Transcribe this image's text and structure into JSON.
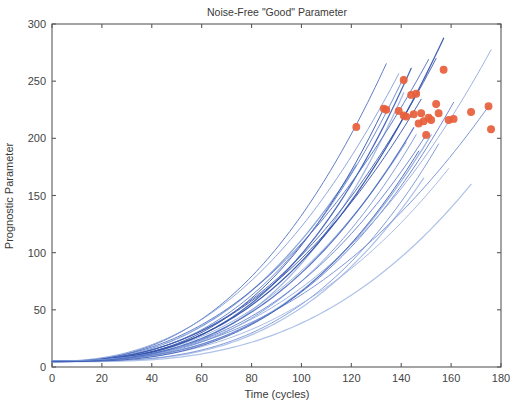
{
  "chart_data": {
    "type": "line",
    "title": "Noise-Free \"Good\" Parameter",
    "xlabel": "Time (cycles)",
    "ylabel": "Prognostic Parameter",
    "xlim": [
      0,
      180
    ],
    "ylim": [
      0,
      300
    ],
    "xticks": [
      0,
      20,
      40,
      60,
      80,
      100,
      120,
      140,
      160,
      180
    ],
    "yticks": [
      0,
      50,
      100,
      150,
      200,
      250,
      300
    ],
    "xtick_labels": [
      "0",
      "20",
      "40",
      "60",
      "80",
      "100",
      "120",
      "140",
      "160",
      "180"
    ],
    "ytick_labels": [
      "0",
      "50",
      "100",
      "150",
      "200",
      "250",
      "300"
    ],
    "grid": false,
    "legend": "none",
    "box": true,
    "line_color_dark": "#2f4fa8",
    "line_color_light": "#8fa9dd",
    "marker_color": "#e8603c",
    "marker_symbol": "filled-circle",
    "note": "Run-to-failure degradation trajectories; each curve ends at a red failure-threshold marker.",
    "series": [
      {
        "name": "unit-1",
        "color": "#7e9cd8",
        "start": 5.0,
        "end_x": 122,
        "end_y": 210
      },
      {
        "name": "unit-2",
        "color": "#2f4fa8",
        "start": 5.2,
        "end_x": 133,
        "end_y": 226
      },
      {
        "name": "unit-3",
        "color": "#4d6cc0",
        "start": 4.6,
        "end_x": 134,
        "end_y": 225
      },
      {
        "name": "unit-4",
        "color": "#9bb2e0",
        "start": 5.4,
        "end_x": 141,
        "end_y": 251
      },
      {
        "name": "unit-5",
        "color": "#5d7ccb",
        "start": 4.8,
        "end_x": 141,
        "end_y": 220
      },
      {
        "name": "unit-6",
        "color": "#8fa9dd",
        "start": 5.1,
        "end_x": 142,
        "end_y": 219
      },
      {
        "name": "unit-7",
        "color": "#3c5cb4",
        "start": 4.9,
        "end_x": 144,
        "end_y": 238
      },
      {
        "name": "unit-8",
        "color": "#7490d4",
        "start": 5.3,
        "end_x": 146,
        "end_y": 239
      },
      {
        "name": "unit-9",
        "color": "#2f4fa8",
        "start": 4.7,
        "end_x": 148,
        "end_y": 222
      },
      {
        "name": "unit-10",
        "color": "#a8bde6",
        "start": 5.5,
        "end_x": 149,
        "end_y": 215
      },
      {
        "name": "unit-11",
        "color": "#5d7ccb",
        "start": 5.0,
        "end_x": 150,
        "end_y": 203
      },
      {
        "name": "unit-12",
        "color": "#4d6cc0",
        "start": 4.5,
        "end_x": 151,
        "end_y": 218
      },
      {
        "name": "unit-13",
        "color": "#8fa9dd",
        "start": 5.2,
        "end_x": 152,
        "end_y": 216
      },
      {
        "name": "unit-14",
        "color": "#3c5cb4",
        "start": 4.8,
        "end_x": 154,
        "end_y": 230
      },
      {
        "name": "unit-15",
        "color": "#7490d4",
        "start": 5.1,
        "end_x": 155,
        "end_y": 222
      },
      {
        "name": "unit-16",
        "color": "#2f4fa8",
        "start": 5.0,
        "end_x": 157,
        "end_y": 260
      },
      {
        "name": "unit-17",
        "color": "#9bb2e0",
        "start": 4.6,
        "end_x": 159,
        "end_y": 216
      },
      {
        "name": "unit-18",
        "color": "#5d7ccb",
        "start": 5.3,
        "end_x": 161,
        "end_y": 217
      },
      {
        "name": "unit-19",
        "color": "#a8bde6",
        "start": 4.9,
        "end_x": 168,
        "end_y": 223
      },
      {
        "name": "unit-20",
        "color": "#6b88d0",
        "start": 5.2,
        "end_x": 175,
        "end_y": 228
      },
      {
        "name": "unit-21",
        "color": "#8fa9dd",
        "start": 5.0,
        "end_x": 176,
        "end_y": 208
      },
      {
        "name": "unit-22",
        "color": "#4d6cc0",
        "start": 4.7,
        "end_x": 145,
        "end_y": 221
      },
      {
        "name": "unit-23",
        "color": "#7e9cd8",
        "start": 5.1,
        "end_x": 139,
        "end_y": 224
      },
      {
        "name": "unit-24",
        "color": "#3c5cb4",
        "start": 4.8,
        "end_x": 147,
        "end_y": 213
      }
    ]
  }
}
